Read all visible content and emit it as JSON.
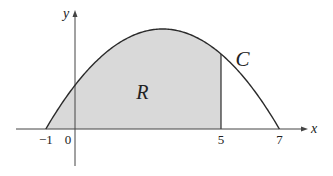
{
  "chart_data": {
    "type": "area",
    "title": "",
    "xlabel": "x",
    "ylabel": "y",
    "curve_label": "C",
    "region_label": "R",
    "curve": {
      "kind": "parabola",
      "roots": [
        -1,
        7
      ],
      "vertex_x": 3
    },
    "shaded_interval": [
      -1,
      5
    ],
    "x_ticks": [
      {
        "value": -1,
        "label": "−1"
      },
      {
        "value": 0,
        "label": "0"
      },
      {
        "value": 5,
        "label": "5"
      },
      {
        "value": 7,
        "label": "7"
      }
    ],
    "xlim": [
      -2,
      8
    ],
    "grid": false,
    "colors": {
      "fill": "#d9d9d9",
      "line": "#2b2b2b",
      "axis": "#444444"
    }
  }
}
